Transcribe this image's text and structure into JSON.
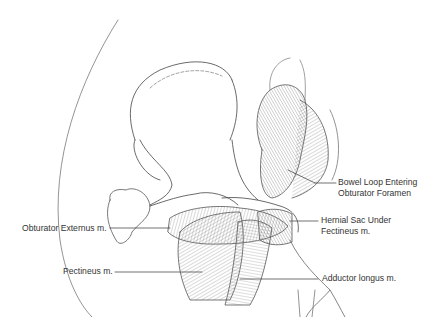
{
  "figure": {
    "labels": [
      {
        "id": "bowel",
        "lines": [
          "Bowel Loop Entering",
          "Obturator Foramen"
        ]
      },
      {
        "id": "hernial_sac",
        "lines": [
          "Hernial Sac Under",
          "Fectineus m."
        ]
      },
      {
        "id": "obturator_externus",
        "lines": [
          "Obturator Externus m."
        ]
      },
      {
        "id": "pectineus",
        "lines": [
          "Pectineus m."
        ]
      },
      {
        "id": "adductor_longus",
        "lines": [
          "Adductor longus m."
        ]
      }
    ],
    "colors": {
      "ink": "#333333",
      "hatch": "#555555",
      "background": "#ffffff"
    }
  }
}
